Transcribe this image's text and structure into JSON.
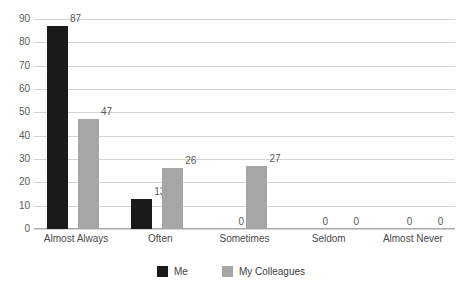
{
  "chart_data": {
    "type": "bar",
    "title": "",
    "xlabel": "",
    "ylabel": "",
    "ylim": [
      0,
      90
    ],
    "ytick_step": 10,
    "yticks": [
      "90",
      "80",
      "70",
      "60",
      "50",
      "40",
      "30",
      "20",
      "10",
      "0"
    ],
    "grid": true,
    "legend_position": "bottom-center",
    "categories": [
      "Almost Always",
      "Often",
      "Sometimes",
      "Seldom",
      "Almost Never"
    ],
    "series": [
      {
        "name": "Me",
        "color": "#1a1a1a",
        "values": [
          87,
          13,
          0,
          0,
          0
        ]
      },
      {
        "name": "My Colleagues",
        "color": "#a6a6a6",
        "values": [
          47,
          26,
          27,
          0,
          0
        ]
      }
    ]
  },
  "colors": {
    "me": "#1a1a1a",
    "colleagues": "#a6a6a6",
    "gridline": "#d4d4d4",
    "axis": "#aaaaaa",
    "text": "#4a4a4a",
    "background": "#ffffff"
  },
  "legend": {
    "items": [
      {
        "label": "Me"
      },
      {
        "label": "My Colleagues"
      }
    ]
  }
}
